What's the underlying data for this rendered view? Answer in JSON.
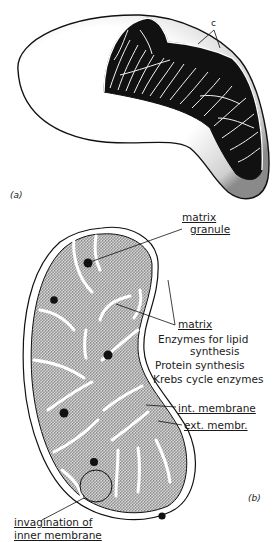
{
  "figure": {
    "panels": [
      {
        "id": "a",
        "label": "(a)",
        "description": "3D cut-away view showing cristae"
      },
      {
        "id": "b",
        "label": "(b)",
        "description": "Sectional view with labelled components"
      }
    ]
  },
  "panel_a": {
    "label": "(a)",
    "cristae_label": "c"
  },
  "panel_b": {
    "label": "(b)",
    "labels": {
      "matrix_granule_1": "matrix",
      "matrix_granule_2": "granule",
      "matrix": "matrix",
      "enzymes_1": "Enzymes for lipid",
      "enzymes_2": "synthesis",
      "protein": "Protein synthesis",
      "krebs": "Krebs cycle enzymes",
      "int_membrane": "int. membrane",
      "ext_membrane": "ext. membr.",
      "invagination_1": "invagination of",
      "invagination_2": "inner membrane"
    }
  },
  "colors": {
    "ink": "#1a1a1a",
    "stipple": "#6b6b6b",
    "background": "#ffffff"
  }
}
